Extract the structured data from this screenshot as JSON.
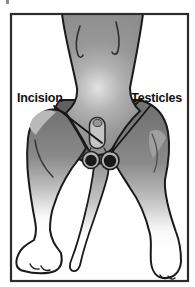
{
  "figure": {
    "name": "dog-neutering-diagram",
    "description_visible": "Grayscale illustration of a dog lying on its back, hindquarters toward viewer, showing neuter surgery site",
    "labels": {
      "incision": "Incision",
      "testicles": "Testicles"
    },
    "colors": {
      "background": "#ffffff",
      "frame_border": "#2b2b2b",
      "body_gray": "#8d8d8d",
      "belly_highlight": "#e2e2e2",
      "shadow_gray": "#606060",
      "outline": "#1a1a1a",
      "testicle_dark": "#191919",
      "testicle_ring": "#b3b3b3",
      "label_text": "#121212"
    }
  }
}
